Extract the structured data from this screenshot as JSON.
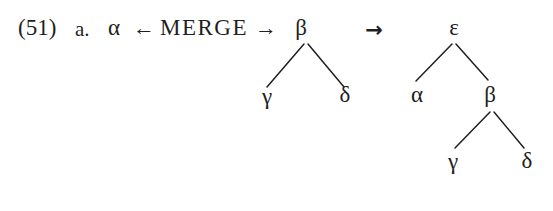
{
  "figure": {
    "example_number": "(51)",
    "item_label": "a.",
    "merge_expression": {
      "left_operand": "α",
      "left_arrow": "←",
      "operator": "MERGE",
      "right_arrow": "→"
    },
    "derivation_arrow": "→",
    "input_tree": {
      "root": "β",
      "left_child": "γ",
      "right_child": "δ"
    },
    "output_tree": {
      "root": "ε",
      "left_child": "α",
      "right_child": "β",
      "right_child_left": "γ",
      "right_child_right": "δ"
    },
    "colors": {
      "ink": "#1f1f1f",
      "background": "#ffffff"
    }
  }
}
